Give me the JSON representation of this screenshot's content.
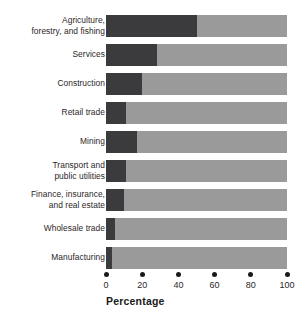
{
  "chart_data": {
    "type": "bar",
    "orientation": "horizontal",
    "stacked": true,
    "title": "",
    "xlabel": "Percentage",
    "ylabel": "",
    "xlim": [
      0,
      100
    ],
    "xticks": [
      0,
      20,
      40,
      60,
      80,
      100
    ],
    "xtick_labels": [
      "0",
      "20",
      "40",
      "60",
      "80",
      "100"
    ],
    "grid": false,
    "legend": "none",
    "categories": [
      "Agriculture,\nforestry, and fishing",
      "Services",
      "Construction",
      "Retail trade",
      "Mining",
      "Transport and\npublic utilities",
      "Finance, insurance,\nand real estate",
      "Wholesale trade",
      "Manufacturing"
    ],
    "series": [
      {
        "name": "dark-segment",
        "color": "#3b3b3d",
        "values": [
          50,
          28,
          20,
          11,
          17,
          11,
          10,
          5,
          3.5
        ]
      },
      {
        "name": "light-segment",
        "color": "#9a9a9a",
        "values": [
          50,
          72,
          80,
          89,
          83,
          89,
          90,
          95,
          96.5
        ]
      }
    ],
    "values": [
      50,
      28,
      20,
      11,
      17,
      11,
      10,
      5,
      3.5
    ]
  },
  "colors": {
    "dark": "#3b3b3d",
    "light": "#9a9a9a",
    "text": "#2b2728",
    "tick": "#1a1a1a",
    "background": "#ffffff"
  }
}
